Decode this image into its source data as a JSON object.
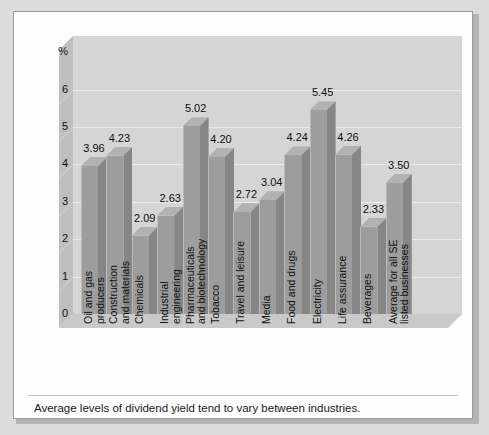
{
  "caption": "Average levels of dividend yield tend to vary between industries.",
  "axis": {
    "y_unit_label": "%",
    "y_ticks": [
      "6",
      "5",
      "4",
      "3",
      "2",
      "1",
      "0"
    ]
  },
  "colors": {
    "page_background": "#dcdcdc",
    "panel_background": "#fdfdfd",
    "panel_border": "#9a9a9a",
    "plot_wall": "#d5d5d5",
    "plot_left_wall": "#bfbfbf",
    "plot_floor": "#c9c9c9",
    "bar_front": "#9d9d9d",
    "bar_side": "#868686",
    "bar_top": "#b2b2b2",
    "gridline": "#ebebeb",
    "text": "#111111"
  },
  "chart_data": {
    "type": "bar",
    "title": "",
    "subtitle": "",
    "xlabel": "",
    "ylabel": "%",
    "ylim": [
      0,
      6.6
    ],
    "ytick_values": [
      0,
      1,
      2,
      3,
      4,
      5,
      6
    ],
    "grid": true,
    "legend": null,
    "data_labels": true,
    "categories": [
      "Oil and gas\nproducers",
      "Construction\nand materials",
      "Chemicals",
      "Industrial\nengineering",
      "Pharmaceuticals\nand biotechnology",
      "Tobacco",
      "Travel and leisure",
      "Media",
      "Food and drugs",
      "Electricity",
      "Life assurance",
      "Beverages",
      "Average for all SE\nlisted businesses"
    ],
    "values": [
      3.96,
      4.23,
      2.09,
      2.63,
      5.02,
      4.2,
      2.72,
      3.04,
      4.24,
      5.45,
      4.26,
      2.33,
      3.5
    ],
    "value_labels": [
      "3.96",
      "4.23",
      "2.09",
      "2.63",
      "5.02",
      "4.20",
      "2.72",
      "3.04",
      "4.24",
      "5.45",
      "4.26",
      "2.33",
      "3.50"
    ],
    "annotation": "Average levels of dividend yield tend to vary between industries."
  }
}
